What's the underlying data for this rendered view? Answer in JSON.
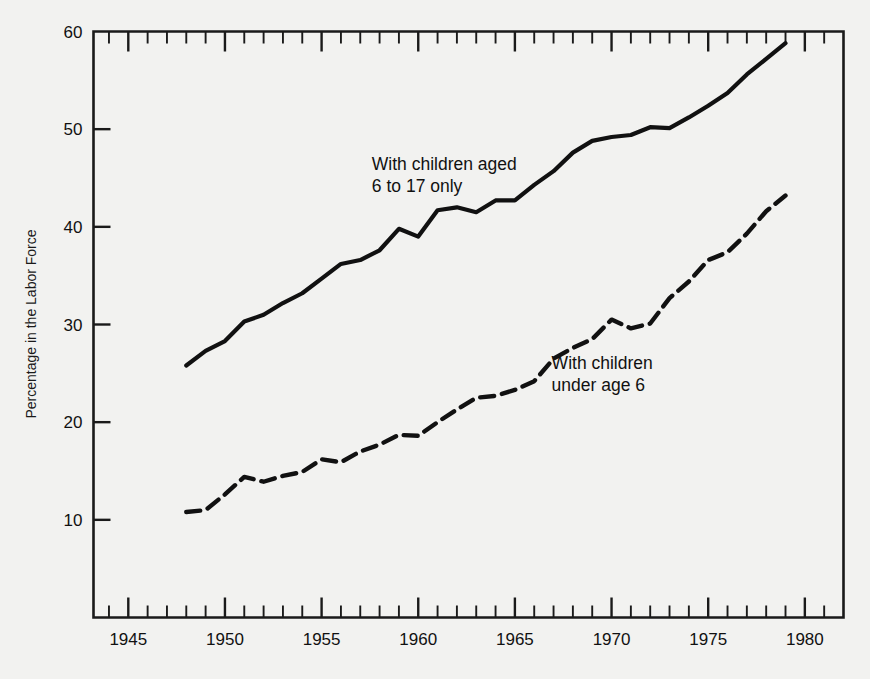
{
  "chart_data": {
    "type": "line",
    "title": "",
    "subtitle": "",
    "xlabel": "",
    "ylabel": "Percentage in the Labor Force",
    "xlim": [
      1943.2,
      1982.0
    ],
    "ylim": [
      0,
      60
    ],
    "y_axis_top_value": 60,
    "grid": false,
    "legend_position": "inline-annotations",
    "x_major_ticks": [
      1945,
      1950,
      1955,
      1960,
      1965,
      1970,
      1975,
      1980
    ],
    "x_major_tick_labels": [
      "1945",
      "1950",
      "1955",
      "1960",
      "1965",
      "1970",
      "1975",
      "1980"
    ],
    "x_minor_tick_interval": 1,
    "y_major_ticks": [
      10,
      20,
      30,
      40,
      50,
      60
    ],
    "y_major_tick_labels": [
      "10",
      "20",
      "30",
      "40",
      "50",
      "60"
    ],
    "annotations": [
      {
        "id": "annot-upper",
        "line1": "With children aged",
        "line2": "6 to 17 only",
        "x": 1957.6,
        "y": 45.8
      },
      {
        "id": "annot-lower",
        "line1": "With children",
        "line2": "under age 6",
        "x": 1966.9,
        "y": 25.4
      }
    ],
    "series": [
      {
        "name": "With children aged 6 to 17 only",
        "style": "solid",
        "color": "#111111",
        "x": [
          1948,
          1949,
          1950,
          1951,
          1952,
          1953,
          1954,
          1955,
          1956,
          1957,
          1958,
          1959,
          1960,
          1961,
          1962,
          1963,
          1964,
          1965,
          1966,
          1967,
          1968,
          1969,
          1970,
          1971,
          1972,
          1973,
          1974,
          1975,
          1976,
          1977,
          1978,
          1979
        ],
        "values": [
          25.8,
          27.3,
          28.3,
          30.3,
          31.0,
          32.2,
          33.2,
          34.7,
          36.2,
          36.6,
          37.6,
          39.8,
          39.0,
          41.7,
          42.0,
          41.5,
          42.7,
          42.7,
          44.3,
          45.7,
          47.6,
          48.8,
          49.2,
          49.4,
          50.2,
          50.1,
          51.2,
          52.4,
          53.7,
          55.6,
          57.2,
          58.8
        ]
      },
      {
        "name": "With children under age 6",
        "style": "dashed",
        "color": "#111111",
        "x": [
          1948,
          1949,
          1950,
          1951,
          1952,
          1953,
          1954,
          1955,
          1956,
          1957,
          1958,
          1959,
          1960,
          1961,
          1962,
          1963,
          1964,
          1965,
          1966,
          1967,
          1968,
          1969,
          1970,
          1971,
          1972,
          1973,
          1974,
          1975,
          1976,
          1977,
          1978,
          1979
        ],
        "values": [
          10.8,
          11.0,
          12.6,
          14.4,
          13.9,
          14.5,
          14.9,
          16.2,
          15.9,
          17.0,
          17.7,
          18.7,
          18.6,
          20.0,
          21.3,
          22.5,
          22.7,
          23.3,
          24.2,
          26.5,
          27.6,
          28.5,
          30.5,
          29.6,
          30.1,
          32.7,
          34.4,
          36.6,
          37.4,
          39.3,
          41.6,
          43.2
        ]
      }
    ]
  }
}
